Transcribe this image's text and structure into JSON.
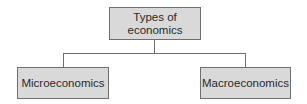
{
  "diagram": {
    "type": "hierarchy",
    "root": {
      "label_line1": "Types of",
      "label_line2": "economics"
    },
    "children": [
      {
        "label": "Microeconomics"
      },
      {
        "label": "Macroeconomics"
      }
    ],
    "colors": {
      "box_fill": "#d9d9d9",
      "box_border": "#6f6f6f",
      "connector": "#6f6f6f",
      "text": "#2a2a2a"
    }
  }
}
